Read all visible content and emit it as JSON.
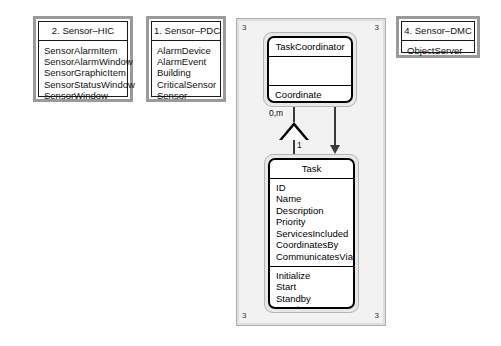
{
  "diagram": {
    "type": "uml-class-diagram",
    "packages": [
      {
        "id": "sensor-hic",
        "title": "2. Sensor–HIC",
        "classes": [
          "SensorAlarmItem",
          "SensorAlarmWindow",
          "SensorGraphicItem",
          "SensorStatusWindow",
          "SensorWindow"
        ]
      },
      {
        "id": "sensor-pdc",
        "title": "1. Sensor–PDC",
        "classes": [
          "AlarmDevice",
          "AlarmEvent",
          "Building",
          "CriticalSensor",
          "Sensor"
        ]
      },
      {
        "id": "sensor-dmc",
        "title": "4. Sensor–DMC",
        "classes": [
          "ObjectServer"
        ]
      }
    ],
    "container": {
      "id": "subsystem-3",
      "corner_label": "3",
      "corners": [
        "3",
        "3",
        "3",
        "3"
      ]
    },
    "classes": [
      {
        "id": "task-coordinator",
        "name": "TaskCoordinator",
        "attributes": [],
        "operations": [
          "Coordinate"
        ]
      },
      {
        "id": "task",
        "name": "Task",
        "attributes": [
          "ID",
          "Name",
          "Description",
          "Priority",
          "ServicesIncluded",
          "CoordinatesBy",
          "CommunicatesVia"
        ],
        "operations": [
          "Initialize",
          "Start",
          "Standby",
          "Terminate"
        ]
      }
    ],
    "relationships": [
      {
        "id": "aggregation",
        "from": "task-coordinator",
        "to": "task",
        "source_multiplicity": "0,m",
        "target_multiplicity": "1",
        "marker": "hollow-triangle"
      },
      {
        "id": "association",
        "from": "task-coordinator",
        "to": "task",
        "marker": "solid-arrow"
      }
    ]
  },
  "colors": {
    "package_border": "#9a9a9a",
    "container_fill": "#f2f2f2",
    "class_border": "#000000",
    "connector": "#3a3a3a"
  }
}
